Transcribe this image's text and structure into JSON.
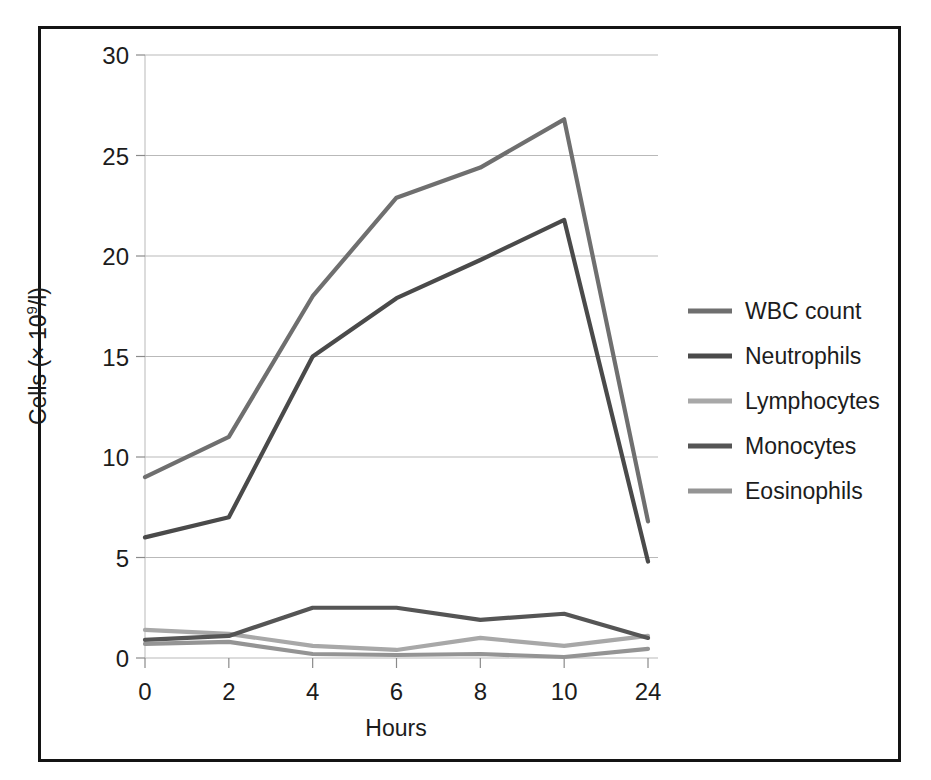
{
  "figure": {
    "background_color": "#ffffff",
    "frame_color": "#141414",
    "has_border": true
  },
  "chart_data": {
    "type": "line",
    "title": "",
    "subtitle": "",
    "xlabel": "Hours",
    "ylabel_prefix": "Cells (× 10",
    "ylabel_exponent": "9",
    "ylabel_suffix": "/l)",
    "ylabel": "Cells (× 10⁹/l)",
    "categories": [
      "0",
      "2",
      "4",
      "6",
      "8",
      "10",
      "24"
    ],
    "x": [
      0,
      2,
      4,
      6,
      8,
      10,
      24
    ],
    "ylim": [
      0,
      30
    ],
    "yticks": [
      "0",
      "5",
      "10",
      "15",
      "20",
      "25",
      "30"
    ],
    "ytick_values": [
      0,
      5,
      10,
      15,
      20,
      25,
      30
    ],
    "grid": true,
    "grid_axis": "y",
    "grid_color": "#b9b9b9",
    "legend_position": "right",
    "series": [
      {
        "name": "WBC count",
        "color": "#6f6f6f",
        "values": [
          9.0,
          11.0,
          18.0,
          22.9,
          24.4,
          26.8,
          6.8
        ]
      },
      {
        "name": "Neutrophils",
        "color": "#4a4a4a",
        "values": [
          6.0,
          7.0,
          15.0,
          17.9,
          19.8,
          21.8,
          4.8
        ]
      },
      {
        "name": "Lymphocytes",
        "color": "#a8a8a8",
        "values": [
          1.4,
          1.2,
          0.6,
          0.4,
          1.0,
          0.6,
          1.1
        ]
      },
      {
        "name": "Monocytes",
        "color": "#555555",
        "values": [
          0.9,
          1.1,
          2.5,
          2.5,
          1.9,
          2.2,
          1.0
        ]
      },
      {
        "name": "Eosinophils",
        "color": "#949494",
        "values": [
          0.7,
          0.8,
          0.2,
          0.15,
          0.2,
          0.05,
          0.45
        ]
      }
    ]
  },
  "plot_geometry": {
    "left": 145,
    "right": 648,
    "top": 55,
    "bottom": 658,
    "legend_x": 688,
    "legend_swatch_width": 44,
    "legend_first_y": 311,
    "legend_row_step": 45
  }
}
